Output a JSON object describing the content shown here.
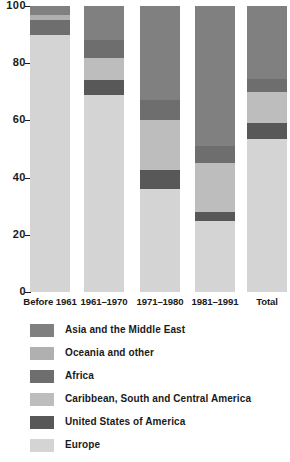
{
  "chart_data": {
    "type": "bar",
    "subtype": "stacked-percentage",
    "title": "",
    "subtitle": "",
    "xlabel": "",
    "ylabel": "",
    "ylim": [
      0,
      100
    ],
    "yticks": [
      0,
      20,
      40,
      60,
      80,
      100
    ],
    "ytick_labels": [
      "0",
      "20",
      "40",
      "60",
      "80",
      "100"
    ],
    "grid": false,
    "legend_position": "bottom-left",
    "categories": [
      "Before 1961",
      "1961–1970",
      "1971–1980",
      "1981–1991",
      "Total"
    ],
    "stack_order_bottom_to_top": [
      "Europe",
      "United States of America",
      "Caribbean, South and Central America",
      "Africa",
      "Oceania and other",
      "Asia and the Middle East"
    ],
    "series": [
      {
        "name": "Europe",
        "color": "#d4d4d4",
        "values": [
          90.0,
          69.0,
          36.0,
          25.0,
          53.5
        ]
      },
      {
        "name": "United States of America",
        "color": "#585858",
        "values": [
          0.0,
          5.0,
          6.5,
          3.0,
          5.5
        ]
      },
      {
        "name": "Caribbean, South and Central America",
        "color": "#bdbdbd",
        "values": [
          0.0,
          8.0,
          17.5,
          17.0,
          11.0
        ]
      },
      {
        "name": "Africa",
        "color": "#6e6e6e",
        "values": [
          5.0,
          6.0,
          7.0,
          6.0,
          4.5
        ]
      },
      {
        "name": "Oceania and other",
        "color": "#b0b0b0",
        "values": [
          2.0,
          0.0,
          0.0,
          0.0,
          0.0
        ]
      },
      {
        "name": "Asia and the Middle East",
        "color": "#808080",
        "values": [
          3.0,
          12.0,
          33.0,
          49.0,
          25.5
        ]
      }
    ]
  },
  "axis": {
    "ticks": [
      {
        "label": "100",
        "value": 100
      },
      {
        "label": "80",
        "value": 80
      },
      {
        "label": "60",
        "value": 60
      },
      {
        "label": "40",
        "value": 40
      },
      {
        "label": "20",
        "value": 20
      },
      {
        "label": "0",
        "value": 0
      }
    ]
  },
  "xaxis": {
    "labels": [
      {
        "text": "Before 1961"
      },
      {
        "text": "1961–1970"
      },
      {
        "text": "1971–1980"
      },
      {
        "text": "1981–1991"
      },
      {
        "text": "Total"
      }
    ]
  },
  "legend": {
    "items": [
      {
        "label": "Asia and the Middle East",
        "color": "#808080"
      },
      {
        "label": "Oceania and other",
        "color": "#b0b0b0"
      },
      {
        "label": "Africa",
        "color": "#6e6e6e"
      },
      {
        "label": "Caribbean, South and Central America",
        "color": "#bdbdbd"
      },
      {
        "label": "United States of America",
        "color": "#585858"
      },
      {
        "label": "Europe",
        "color": "#d4d4d4"
      }
    ]
  }
}
